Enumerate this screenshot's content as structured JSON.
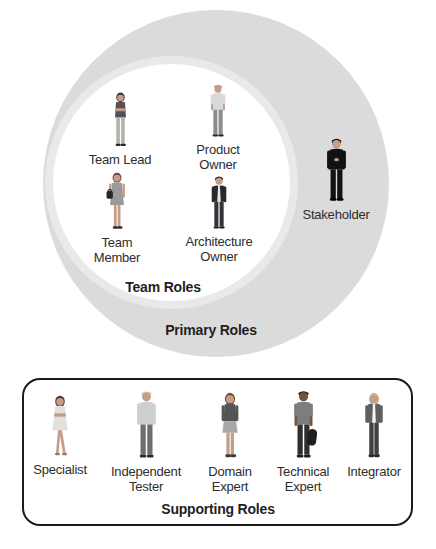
{
  "colors": {
    "page-bg": "#ffffff",
    "primary-circle": "#dbdbdb",
    "team-circle": "#ffffff",
    "team-circle-halo": "#e9e9e9",
    "box-border": "#1c1c1c",
    "label-text": "#2d2d2d",
    "section-label-text": "#1f1f1f"
  },
  "primary": {
    "label": "Primary Roles",
    "team": {
      "label": "Team Roles",
      "roles": [
        {
          "label": "Team Lead",
          "figure": "woman-arms-crossed"
        },
        {
          "label": "Product\nOwner",
          "figure": "man-standing"
        },
        {
          "label": "Team\nMember",
          "figure": "woman-with-handbag"
        },
        {
          "label": "Architecture\nOwner",
          "figure": "man-in-blazer"
        }
      ]
    },
    "stakeholder": {
      "label": "Stakeholder",
      "figure": "man-in-black-suit"
    }
  },
  "supporting": {
    "label": "Supporting Roles",
    "roles": [
      {
        "label": "Specialist",
        "figure": "woman-in-dress"
      },
      {
        "label": "Independent\nTester",
        "figure": "man-light-shirt"
      },
      {
        "label": "Domain\nExpert",
        "figure": "woman-jacket-skirt"
      },
      {
        "label": "Technical\nExpert",
        "figure": "man-with-backpack"
      },
      {
        "label": "Integrator",
        "figure": "woman-blonde-jacket"
      }
    ]
  }
}
